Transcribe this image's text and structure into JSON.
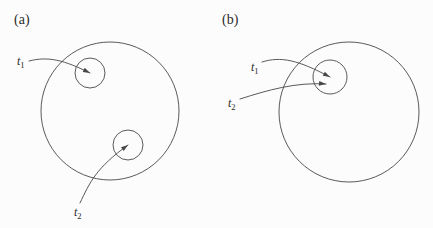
{
  "figure": {
    "background_color": "#fcfcfc",
    "stroke_color": "#474747",
    "text_color": "#2b2b2b",
    "panels": [
      {
        "id": "a",
        "label": "(a)",
        "label_x": 14,
        "label_y": 24,
        "big_circle": {
          "cx": 110,
          "cy": 111,
          "r": 69
        },
        "small_circles": [
          {
            "name": "t1",
            "cx": 90,
            "cy": 73,
            "r": 15
          },
          {
            "name": "t2",
            "cx": 128,
            "cy": 145,
            "r": 15
          }
        ],
        "annotations": [
          {
            "name": "t1",
            "base": "t",
            "subscript": "1",
            "label_x": 17,
            "label_y": 65,
            "path": "M 29 61 C 48 56, 64 60, 90 73",
            "arrow_x": 90,
            "arrow_y": 73,
            "arrow_angle": 26
          },
          {
            "name": "t2",
            "base": "t",
            "subscript": "2",
            "label_x": 74,
            "label_y": 216,
            "path": "M 80 203 C 90 182, 96 168, 128 145",
            "arrow_x": 128,
            "arrow_y": 145,
            "arrow_angle": -36
          }
        ]
      },
      {
        "id": "b",
        "label": "(b)",
        "label_x": 222,
        "label_y": 24,
        "big_circle": {
          "cx": 349,
          "cy": 112,
          "r": 70
        },
        "small_circles": [
          {
            "name": "t1t2",
            "cx": 330,
            "cy": 77,
            "r": 17
          }
        ],
        "annotations": [
          {
            "name": "t1",
            "base": "t",
            "subscript": "1",
            "label_x": 251,
            "label_y": 71,
            "path": "M 262 62 C 281 56, 298 60, 330 77",
            "arrow_x": 330,
            "arrow_y": 77,
            "arrow_angle": 28
          },
          {
            "name": "t2",
            "base": "t",
            "subscript": "2",
            "label_x": 228,
            "label_y": 107,
            "path": "M 240 99 C 268 90, 296 82, 326 84",
            "arrow_x": 326,
            "arrow_y": 84,
            "arrow_angle": 5
          }
        ]
      }
    ]
  }
}
